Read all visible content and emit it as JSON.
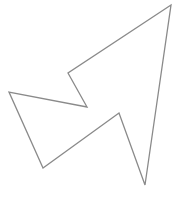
{
  "canvas": {
    "width": 183,
    "height": 215,
    "background": "#ffffff"
  },
  "shape": {
    "type": "polygon",
    "description": "arrow-like outline polygon",
    "stroke": "#8a8a8a",
    "stroke_width": 1.3,
    "fill": "none",
    "points": [
      [
        171,
        5
      ],
      [
        68,
        73
      ],
      [
        87,
        107
      ],
      [
        9,
        92
      ],
      [
        43,
        168
      ],
      [
        119,
        113
      ],
      [
        145,
        185
      ]
    ]
  }
}
